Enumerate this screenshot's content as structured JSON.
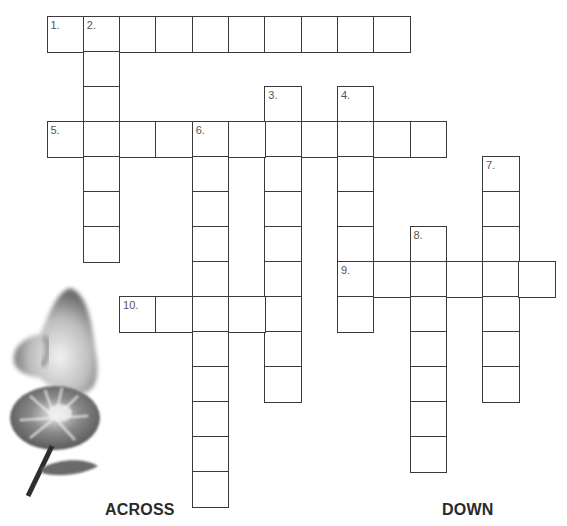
{
  "grid": {
    "origin_x": 46.5,
    "origin_y": 16,
    "cell_w": 36.3,
    "cell_h": 35,
    "clues": [
      {
        "number": "1.",
        "direction": "across",
        "row": 0,
        "col": 0,
        "length": 10
      },
      {
        "number": "2.",
        "direction": "down",
        "row": 0,
        "col": 1,
        "length": 7
      },
      {
        "number": "3.",
        "direction": "down",
        "row": 2,
        "col": 6,
        "length": 9
      },
      {
        "number": "4.",
        "direction": "down",
        "row": 2,
        "col": 8,
        "length": 7
      },
      {
        "number": "5.",
        "direction": "across",
        "row": 3,
        "col": 0,
        "length": 11
      },
      {
        "number": "6.",
        "direction": "down",
        "row": 3,
        "col": 4,
        "length": 11
      },
      {
        "number": "7.",
        "direction": "down",
        "row": 4,
        "col": 12,
        "length": 7
      },
      {
        "number": "8.",
        "direction": "down",
        "row": 6,
        "col": 10,
        "length": 7
      },
      {
        "number": "9.",
        "direction": "across",
        "row": 7,
        "col": 8,
        "length": 6
      },
      {
        "number": "10.",
        "direction": "across",
        "row": 8,
        "col": 2,
        "length": 5
      }
    ]
  },
  "headings": {
    "across": "ACROSS",
    "down": "DOWN"
  },
  "illustration": {
    "icon": "nose-smelling-flower-illustration"
  },
  "colors": {
    "border": "#3a3a3a",
    "text": "#2a2a2a",
    "number": "#555555"
  }
}
